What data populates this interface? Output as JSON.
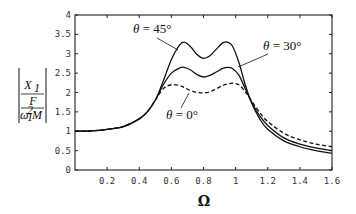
{
  "chart_data": {
    "type": "line",
    "title": "",
    "xlabel": "Ω",
    "ylabel": "|X1 / (F / (ω1² M))|",
    "ylabel_parts": {
      "numerator": "X",
      "numerator_sub": "1",
      "mid": "F",
      "denominator": "ω",
      "denominator_sub": "1",
      "denominator_sup": "2",
      "denominator_tail": "M"
    },
    "xlim": [
      0,
      1.6
    ],
    "ylim": [
      0,
      4
    ],
    "grid": false,
    "x_ticks": [
      0.2,
      0.4,
      0.6,
      0.8,
      1,
      1.2,
      1.4,
      1.6
    ],
    "x_tick_labels": [
      "0.2",
      "0.4",
      "0.6",
      "0.8",
      "1",
      "1.2",
      "1.4",
      "1.6"
    ],
    "y_ticks": [
      0,
      0.5,
      1,
      1.5,
      2,
      2.5,
      3,
      3.5,
      4
    ],
    "y_tick_labels": [
      "0",
      "0.5",
      "1",
      "1.5",
      "2",
      "2.5",
      "3",
      "3.5",
      "4"
    ],
    "x": [
      0,
      0.1,
      0.2,
      0.3,
      0.4,
      0.45,
      0.5,
      0.55,
      0.6,
      0.65,
      0.68,
      0.72,
      0.76,
      0.8,
      0.84,
      0.88,
      0.92,
      0.95,
      0.98,
      1.02,
      1.06,
      1.1,
      1.15,
      1.2,
      1.3,
      1.4,
      1.5,
      1.6
    ],
    "series": [
      {
        "name": "θ = 45°",
        "style": "solid",
        "values": [
          1.0,
          1.01,
          1.05,
          1.12,
          1.32,
          1.5,
          1.8,
          2.3,
          2.85,
          3.22,
          3.3,
          3.18,
          2.98,
          2.88,
          2.95,
          3.12,
          3.28,
          3.3,
          3.2,
          2.78,
          2.2,
          1.72,
          1.32,
          1.05,
          0.75,
          0.6,
          0.5,
          0.43
        ]
      },
      {
        "name": "θ = 30°",
        "style": "solid",
        "values": [
          1.0,
          1.01,
          1.05,
          1.12,
          1.32,
          1.5,
          1.8,
          2.2,
          2.5,
          2.63,
          2.65,
          2.58,
          2.46,
          2.4,
          2.44,
          2.53,
          2.62,
          2.65,
          2.62,
          2.45,
          2.1,
          1.75,
          1.4,
          1.15,
          0.83,
          0.67,
          0.57,
          0.5
        ]
      },
      {
        "name": "θ = 0°",
        "style": "dashed",
        "values": [
          1.0,
          1.01,
          1.05,
          1.12,
          1.32,
          1.5,
          1.8,
          2.1,
          2.2,
          2.18,
          2.13,
          2.05,
          2.0,
          1.99,
          2.02,
          2.1,
          2.18,
          2.22,
          2.24,
          2.2,
          2.02,
          1.78,
          1.48,
          1.25,
          0.95,
          0.78,
          0.67,
          0.6
        ]
      }
    ],
    "annotations": [
      {
        "text": "θ = 45°",
        "target_series": "θ = 45°"
      },
      {
        "text": "θ = 30°",
        "target_series": "θ = 30°"
      },
      {
        "text": "θ = 0°",
        "target_series": "θ = 0°"
      }
    ],
    "colors": {
      "line": "#111111",
      "axis": "#222222",
      "background": "#ffffff"
    }
  },
  "labels": {
    "theta45": {
      "sym": "θ",
      "rest": " = 45°"
    },
    "theta30": {
      "sym": "θ",
      "rest": " = 30°"
    },
    "theta0": {
      "sym": "θ",
      "rest": " = 0°"
    }
  }
}
